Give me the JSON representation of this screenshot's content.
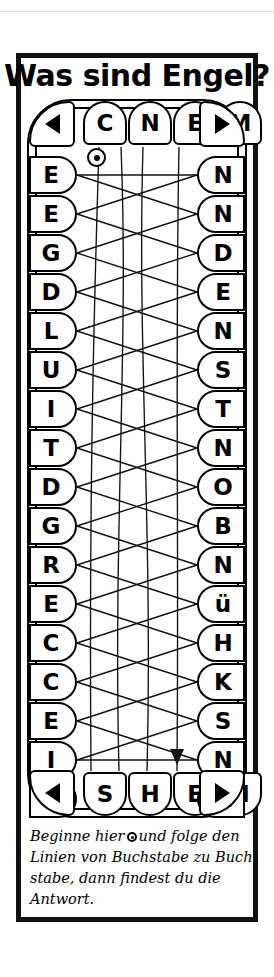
{
  "title": "Was sind Engel?",
  "puzzle": {
    "type": "connect-the-letters",
    "top_letters": [
      "C",
      "N",
      "E",
      "M"
    ],
    "bottom_letters": [
      "S",
      "H",
      "E",
      "N"
    ],
    "left_letters": [
      "E",
      "E",
      "G",
      "D",
      "L",
      "U",
      "I",
      "T",
      "D",
      "G",
      "R",
      "E",
      "C",
      "C",
      "E",
      "I",
      "Z"
    ],
    "right_letters": [
      "N",
      "N",
      "D",
      "E",
      "N",
      "S",
      "T",
      "N",
      "O",
      "B",
      "N",
      "ü",
      "H",
      "K",
      "S",
      "N",
      "W"
    ],
    "corner_arrows": {
      "top_left": "triangle-left",
      "top_right": "triangle-right",
      "bottom_left": "triangle-left",
      "bottom_right": "triangle-right"
    },
    "start_marker": "circle-dot",
    "end_marker": "arrowhead-down"
  },
  "caption": {
    "line1_a": "Beginne hier",
    "line1_b": "und folge den",
    "line2": "Linien von Buchstabe zu Buch-",
    "line3": "stabe, dann findest du die",
    "line4": "Antwort."
  },
  "colors": {
    "ink": "#111111",
    "paper": "#ffffff"
  }
}
